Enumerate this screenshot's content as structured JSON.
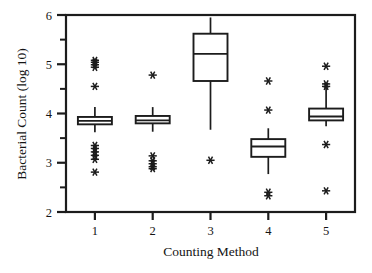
{
  "chart_data": {
    "type": "box",
    "title": "",
    "xlabel": "Counting Method",
    "ylabel": "Bacterial Count (log 10)",
    "categories": [
      "1",
      "2",
      "3",
      "4",
      "5"
    ],
    "xtick_labels": [
      "1",
      "2",
      "3",
      "4",
      "5"
    ],
    "ytick_labels": [
      "2",
      "3",
      "4",
      "5",
      "6"
    ],
    "ytick_values": [
      2,
      3,
      4,
      5,
      6
    ],
    "yminor_values": [
      2.5,
      3.5,
      4.5,
      5.5
    ],
    "ylim": [
      2,
      6
    ],
    "grid": false,
    "legend": null,
    "boxes": [
      {
        "category": "1",
        "whisker_low": 3.62,
        "q1": 3.78,
        "median": 3.85,
        "q3": 3.93,
        "whisker_high": 4.13,
        "outliers": [
          5.08,
          5.04,
          4.99,
          4.94,
          4.55,
          3.35,
          3.29,
          3.22,
          3.15,
          3.07,
          2.81
        ]
      },
      {
        "category": "2",
        "whisker_low": 3.63,
        "q1": 3.8,
        "median": 3.86,
        "q3": 3.95,
        "whisker_high": 4.13,
        "outliers": [
          4.78,
          3.14,
          3.04,
          2.98,
          2.92,
          2.88
        ]
      },
      {
        "category": "3",
        "whisker_low": 3.67,
        "q1": 4.66,
        "median": 5.21,
        "q3": 5.62,
        "whisker_high": 5.95,
        "outliers": [
          3.05
        ]
      },
      {
        "category": "4",
        "whisker_low": 2.77,
        "q1": 3.12,
        "median": 3.33,
        "q3": 3.48,
        "whisker_high": 3.7,
        "outliers": [
          4.66,
          4.07,
          2.4,
          2.33
        ]
      },
      {
        "category": "5",
        "whisker_low": 3.74,
        "q1": 3.86,
        "median": 3.94,
        "q3": 4.1,
        "whisker_high": 4.52,
        "outliers": [
          4.96,
          4.6,
          4.55,
          3.37,
          2.43
        ]
      }
    ]
  }
}
